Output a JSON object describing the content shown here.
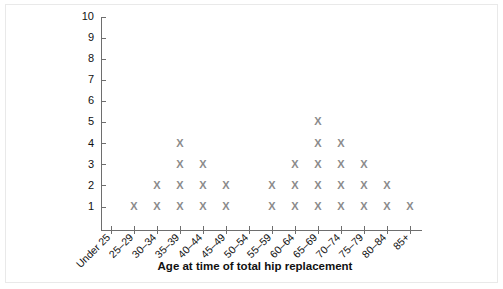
{
  "chart_data": {
    "type": "scatter",
    "plot_style": "dot-plot",
    "title": "",
    "xlabel": "Age at time of total hip replacement",
    "ylabel": "",
    "categories": [
      "Under 25",
      "25–29",
      "30–34",
      "35–39",
      "40–44",
      "45–49",
      "50–54",
      "55–59",
      "60–64",
      "65–69",
      "70–74",
      "75–79",
      "80–84",
      "85+"
    ],
    "values": [
      0,
      1,
      2,
      4,
      3,
      2,
      0,
      2,
      3,
      5,
      4,
      3,
      2,
      1
    ],
    "ylim": [
      0,
      10
    ],
    "ytick_labels": [
      "1",
      "2",
      "3",
      "4",
      "5",
      "6",
      "7",
      "8",
      "9",
      "10"
    ],
    "ytick_values": [
      1,
      2,
      3,
      4,
      5,
      6,
      7,
      8,
      9,
      10
    ],
    "marker_glyph": "X",
    "marker_color": "#8b8b8b",
    "axis_color": "#6e6e6e",
    "grid": false,
    "legend": false,
    "background_color": "#ffffff",
    "frame_color": "#e9e9e9"
  }
}
